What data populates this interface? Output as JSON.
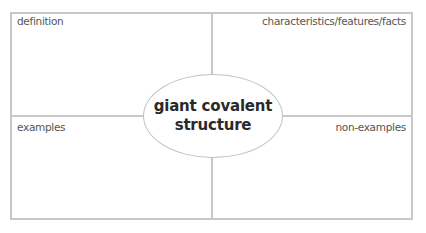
{
  "diagram": {
    "type": "frayer-model",
    "center": {
      "line1": "giant covalent",
      "line2": "structure"
    },
    "quadrants": {
      "top_left": "definition",
      "top_right": "characteristics/features/facts",
      "bottom_left": "examples",
      "bottom_right": "non-examples"
    },
    "colors": {
      "border": "#c8c8c8",
      "label_text": "#555555",
      "center_text": "#2a2a2a",
      "background": "#ffffff"
    }
  }
}
